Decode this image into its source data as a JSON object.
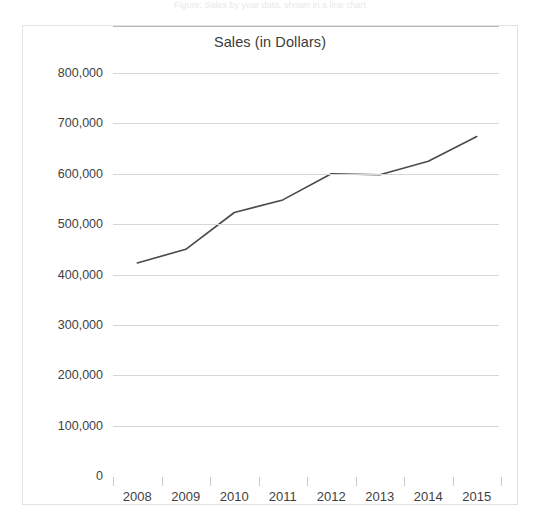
{
  "page": {
    "top_caption": "Figure: Sales by year data, shown in a line chart"
  },
  "chart_panel": {
    "title": "Sales (in Dollars)",
    "border_color": "#e2e2e4",
    "background_color": "#ffffff"
  },
  "chart_data": {
    "type": "line",
    "title": "Sales (in Dollars)",
    "xlabel": "",
    "ylabel": "",
    "categories": [
      "2008",
      "2009",
      "2010",
      "2011",
      "2012",
      "2013",
      "2014",
      "2015"
    ],
    "values": [
      423000,
      450000,
      523000,
      548000,
      600000,
      598000,
      625000,
      674000
    ],
    "series": [
      {
        "name": "Sales",
        "color": "#4a4a4a",
        "values": [
          423000,
          450000,
          523000,
          548000,
          600000,
          598000,
          625000,
          674000
        ]
      }
    ],
    "ylim": [
      0,
      800000
    ],
    "ytick_values": [
      0,
      100000,
      200000,
      300000,
      400000,
      500000,
      600000,
      700000,
      800000
    ],
    "ytick_labels": [
      "0",
      "100,000",
      "200,000",
      "300,000",
      "400,000",
      "500,000",
      "600,000",
      "700,000",
      "800,000"
    ],
    "grid": true,
    "grid_color": "#d6d6d8",
    "legend": "none",
    "line_color": "#4a4a4a",
    "line_width": 1.6,
    "markers": false
  }
}
